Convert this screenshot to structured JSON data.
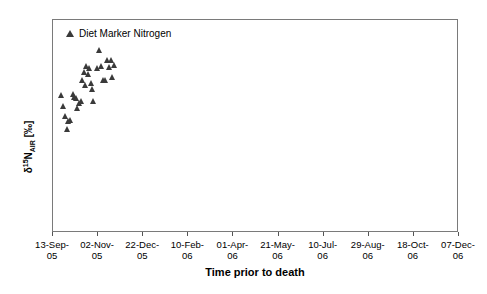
{
  "chart_data": {
    "type": "scatter",
    "title": "",
    "xlabel": "Time prior to death",
    "ylabel": "δ¹⁵N_AIR [‰]",
    "ylabel_parts": {
      "delta": "δ",
      "mass": "15",
      "element": "N",
      "standard": "AIR",
      "units": "[‰]"
    },
    "ylim": [
      2,
      12
    ],
    "ytick_labels": [
      "12",
      "11",
      "10",
      "9",
      "8",
      "7",
      "6",
      "5",
      "4",
      "3",
      "2"
    ],
    "yticks": [
      12,
      11,
      10,
      9,
      8,
      7,
      6,
      5,
      4,
      3,
      2
    ],
    "xtick_labels": [
      "13-Sep-05",
      "02-Nov-05",
      "22-Dec-05",
      "10-Feb-06",
      "01-Apr-06",
      "21-May-06",
      "10-Jul-06",
      "29-Aug-06",
      "18-Oct-06",
      "07-Dec-06"
    ],
    "grid": false,
    "legend_position": "top-left",
    "series": [
      {
        "name": "Diet Marker Nitrogen",
        "marker": "triangle",
        "color": "#3a3a3a",
        "points": [
          {
            "x": 0.205,
            "y": 8.45
          },
          {
            "x": 0.255,
            "y": 7.9
          },
          {
            "x": 0.3,
            "y": 7.42
          },
          {
            "x": 0.335,
            "y": 6.85
          },
          {
            "x": 0.372,
            "y": 7.2
          },
          {
            "x": 0.412,
            "y": 7.25
          },
          {
            "x": 0.468,
            "y": 8.48
          },
          {
            "x": 0.503,
            "y": 8.35
          },
          {
            "x": 0.54,
            "y": 8.3
          },
          {
            "x": 0.578,
            "y": 7.82
          },
          {
            "x": 0.613,
            "y": 8.05
          },
          {
            "x": 0.648,
            "y": 8.15
          },
          {
            "x": 0.688,
            "y": 9.15
          },
          {
            "x": 0.718,
            "y": 9.5
          },
          {
            "x": 0.748,
            "y": 8.9
          },
          {
            "x": 0.778,
            "y": 9.8
          },
          {
            "x": 0.808,
            "y": 9.4
          },
          {
            "x": 0.838,
            "y": 9.7
          },
          {
            "x": 0.868,
            "y": 9.0
          },
          {
            "x": 0.898,
            "y": 8.7
          },
          {
            "x": 0.928,
            "y": 8.15
          },
          {
            "x": 1.0,
            "y": 9.7
          },
          {
            "x": 1.062,
            "y": 10.55
          },
          {
            "x": 1.11,
            "y": 9.8
          },
          {
            "x": 1.148,
            "y": 9.12
          },
          {
            "x": 1.182,
            "y": 9.15
          },
          {
            "x": 1.232,
            "y": 10.05
          },
          {
            "x": 1.268,
            "y": 9.75
          },
          {
            "x": 1.312,
            "y": 10.05
          },
          {
            "x": 1.352,
            "y": 9.28
          },
          {
            "x": 1.398,
            "y": 9.82
          }
        ]
      }
    ]
  },
  "legend": {
    "label": "Diet Marker Nitrogen"
  },
  "axes": {
    "x_title": "Time prior to death"
  }
}
